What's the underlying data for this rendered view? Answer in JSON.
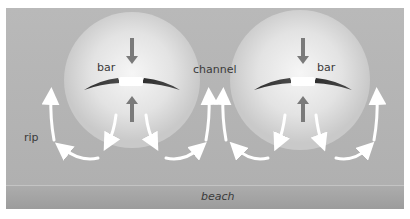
{
  "diagram": {
    "labels": {
      "bar_left": "bar",
      "bar_right": "bar",
      "channel": "channel",
      "rip": "rip",
      "beach": "beach"
    },
    "colors": {
      "water": "#b4b4b4",
      "glow_center": "#f4f4f4",
      "glow_edge": "#c8c8c8",
      "bar": "#3c3c3c",
      "arrow_grey": "#7a7a7a",
      "arrow_white": "#ffffff",
      "beach_top": "#a8a8a8",
      "beach_bottom": "#999999",
      "label": "#3a3a3a"
    },
    "elements": {
      "bars": 2,
      "grey_arrows_per_bar": 2,
      "white_current_arrows_per_bar": 4
    }
  }
}
